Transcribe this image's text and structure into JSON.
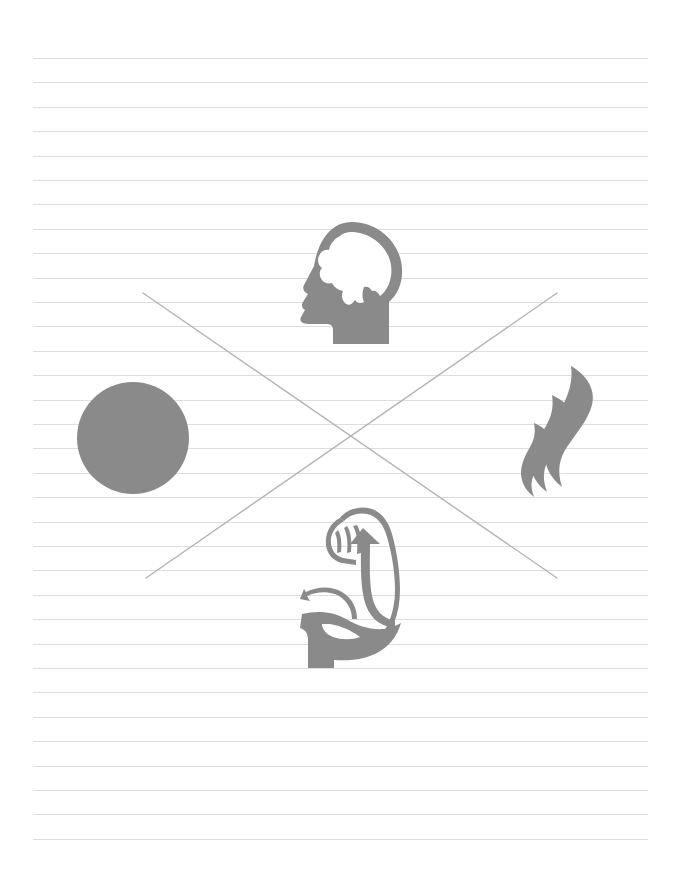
{
  "page": {
    "background_color": "#ffffff",
    "width": 679,
    "height": 880
  },
  "paper": {
    "name": "ruled-notebook-paper",
    "line_color": "#dedede",
    "line_count": 33,
    "line_start_x": 33,
    "line_end_x": 648,
    "first_line_y": 58,
    "line_spacing": 24.4
  },
  "cross_mark": {
    "name": "crossed-out-x-mark",
    "color": "#b4b4b4",
    "stroke_width": 1.4,
    "stroke_1": {
      "x1": 143,
      "y1": 293,
      "x2": 557,
      "y2": 578
    },
    "stroke_2": {
      "x1": 557,
      "y1": 293,
      "x2": 146,
      "y2": 578
    }
  },
  "icons": {
    "color": "#8a8a8a",
    "items": [
      {
        "id": "head-brain-icon",
        "label": "Head with Brain",
        "meaning": "mind",
        "position": "top",
        "x": 288,
        "y": 220,
        "width": 120,
        "height": 124
      },
      {
        "id": "dollar-coin-icon",
        "label": "Dollar Coin",
        "meaning": "money",
        "symbol": "$",
        "position": "left",
        "x": 76,
        "y": 381,
        "width": 114,
        "height": 114
      },
      {
        "id": "flame-icon",
        "label": "Flame",
        "meaning": "energy",
        "position": "right",
        "x": 521,
        "y": 365,
        "width": 88,
        "height": 138
      },
      {
        "id": "flexed-bicep-icon",
        "label": "Flexed Bicep Arm",
        "meaning": "strength",
        "position": "bottom",
        "x": 300,
        "y": 506,
        "width": 104,
        "height": 162
      }
    ]
  }
}
